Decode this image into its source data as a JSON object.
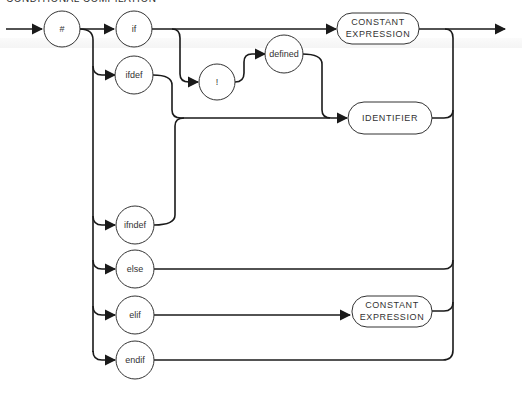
{
  "title": "CONDITIONAL COMPILATION",
  "diagram": {
    "type": "syntax-diagram",
    "start_node": {
      "id": "hash",
      "label": "#"
    },
    "directives": [
      {
        "id": "if",
        "label": "if"
      },
      {
        "id": "ifdef",
        "label": "ifdef"
      },
      {
        "id": "ifndef",
        "label": "ifndef"
      },
      {
        "id": "else",
        "label": "else"
      },
      {
        "id": "elif",
        "label": "elif"
      },
      {
        "id": "endif",
        "label": "endif"
      }
    ],
    "operators": [
      {
        "id": "not",
        "label": "!"
      },
      {
        "id": "defined",
        "label": "defined"
      }
    ],
    "terminals": {
      "const_expr_top": {
        "line1": "CONSTANT",
        "line2": "EXPRESSION"
      },
      "identifier": {
        "label": "IDENTIFIER"
      },
      "const_expr_bottom": {
        "line1": "CONSTANT",
        "line2": "EXPRESSION"
      }
    },
    "edges": [
      [
        "entry",
        "hash"
      ],
      [
        "hash",
        "if"
      ],
      [
        "hash",
        "ifdef"
      ],
      [
        "hash",
        "ifndef"
      ],
      [
        "hash",
        "else"
      ],
      [
        "hash",
        "elif"
      ],
      [
        "hash",
        "endif"
      ],
      [
        "if",
        "const_expr_top"
      ],
      [
        "if",
        "not"
      ],
      [
        "if",
        "defined"
      ],
      [
        "not",
        "defined"
      ],
      [
        "defined",
        "identifier"
      ],
      [
        "ifdef",
        "identifier"
      ],
      [
        "ifndef",
        "identifier"
      ],
      [
        "elif",
        "const_expr_bottom"
      ],
      [
        "const_expr_top",
        "exit"
      ],
      [
        "identifier",
        "exit"
      ],
      [
        "else",
        "exit"
      ],
      [
        "const_expr_bottom",
        "exit"
      ],
      [
        "endif",
        "exit"
      ]
    ]
  }
}
